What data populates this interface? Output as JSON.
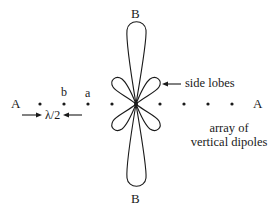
{
  "diagram": {
    "labels": {
      "top_axis": "B",
      "bottom_axis": "B",
      "left_axis": "A",
      "right_axis": "A",
      "element_b": "b",
      "element_a": "a",
      "spacing": "λ/2",
      "side_lobes": "side lobes",
      "array_line1": "array of",
      "array_line2": "vertical dipoles"
    },
    "geometry": {
      "center": [
        136,
        104
      ],
      "dot_spacing_px": 24,
      "dots_left_x": [
        40,
        64,
        88,
        112
      ],
      "dots_right_x": [
        160,
        184,
        208,
        232
      ],
      "dot_y": 104,
      "main_lobe_length_px": 83,
      "side_lobe_angles_deg": [
        35,
        145,
        215,
        325
      ]
    },
    "colors": {
      "stroke": "#1a1a1a",
      "background": "#ffffff"
    }
  }
}
